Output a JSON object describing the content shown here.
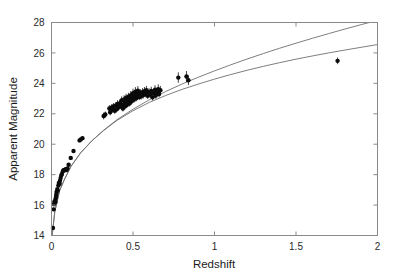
{
  "figure": {
    "name": "hubble-diagram",
    "background_color": "#ffffff",
    "frame_color": "#8a8a8a",
    "point_color": "#0a0a0a",
    "curve_color": "#6f6f6f"
  },
  "chart_data": {
    "type": "scatter",
    "title": "",
    "subtitle": "",
    "xlabel": "Redshift",
    "ylabel": "Apparent Magnitude",
    "xlim": [
      0,
      2
    ],
    "ylim": [
      14,
      28
    ],
    "y_inverted": false,
    "grid": false,
    "legend": null,
    "legend_position": "none",
    "xticks": [
      0,
      0.5,
      1,
      1.5,
      2
    ],
    "xtick_labels": [
      "0",
      "0.5",
      "1",
      "1.5",
      "2"
    ],
    "yticks": [
      14,
      16,
      18,
      20,
      22,
      24,
      26,
      28
    ],
    "ytick_labels": [
      "14",
      "16",
      "18",
      "20",
      "22",
      "24",
      "26",
      "28"
    ],
    "annotations": [],
    "series": [
      {
        "name": "supernovae",
        "marker": "filled-circle",
        "errorbars": "vertical",
        "x": [
          0.009,
          0.013,
          0.015,
          0.018,
          0.022,
          0.024,
          0.026,
          0.028,
          0.03,
          0.032,
          0.036,
          0.038,
          0.042,
          0.045,
          0.05,
          0.052,
          0.056,
          0.06,
          0.064,
          0.07,
          0.074,
          0.078,
          0.082,
          0.088,
          0.092,
          0.098,
          0.105,
          0.118,
          0.135,
          0.172,
          0.18,
          0.19,
          0.32,
          0.33,
          0.355,
          0.36,
          0.37,
          0.375,
          0.38,
          0.388,
          0.395,
          0.4,
          0.405,
          0.412,
          0.42,
          0.425,
          0.43,
          0.438,
          0.44,
          0.445,
          0.45,
          0.452,
          0.458,
          0.462,
          0.468,
          0.472,
          0.478,
          0.48,
          0.485,
          0.49,
          0.495,
          0.5,
          0.505,
          0.51,
          0.515,
          0.52,
          0.526,
          0.53,
          0.538,
          0.545,
          0.55,
          0.558,
          0.562,
          0.57,
          0.578,
          0.582,
          0.59,
          0.598,
          0.605,
          0.612,
          0.62,
          0.628,
          0.635,
          0.64,
          0.648,
          0.655,
          0.66,
          0.668,
          0.778,
          0.828,
          0.84,
          1.755
        ],
        "y": [
          14.5,
          15.72,
          16.05,
          16.22,
          16.28,
          16.2,
          16.45,
          16.6,
          16.75,
          16.9,
          17.05,
          16.95,
          17.28,
          17.45,
          17.4,
          17.6,
          17.78,
          17.95,
          18.05,
          18.22,
          18.3,
          18.28,
          18.32,
          18.35,
          18.3,
          18.4,
          18.65,
          19.1,
          19.55,
          20.25,
          20.32,
          20.4,
          21.85,
          21.95,
          22.35,
          22.1,
          22.42,
          22.28,
          22.48,
          22.2,
          22.55,
          22.3,
          22.65,
          22.42,
          22.7,
          22.52,
          22.88,
          22.35,
          22.62,
          22.95,
          22.48,
          22.75,
          23.05,
          22.58,
          22.85,
          23.12,
          22.68,
          22.98,
          23.2,
          22.8,
          23.08,
          23.35,
          22.92,
          23.18,
          23.45,
          23.02,
          23.28,
          23.52,
          23.1,
          23.38,
          23.15,
          23.42,
          23.22,
          23.48,
          23.3,
          23.55,
          23.18,
          23.42,
          23.25,
          23.5,
          23.08,
          23.35,
          23.58,
          23.2,
          23.45,
          23.62,
          23.3,
          23.55,
          24.38,
          24.45,
          24.2,
          25.48
        ],
        "yerr": [
          0.1,
          0.1,
          0.1,
          0.1,
          0.1,
          0.1,
          0.1,
          0.1,
          0.1,
          0.1,
          0.1,
          0.1,
          0.1,
          0.1,
          0.1,
          0.1,
          0.1,
          0.1,
          0.1,
          0.1,
          0.1,
          0.1,
          0.1,
          0.1,
          0.1,
          0.1,
          0.1,
          0.1,
          0.1,
          0.12,
          0.12,
          0.12,
          0.22,
          0.2,
          0.22,
          0.2,
          0.22,
          0.2,
          0.22,
          0.2,
          0.22,
          0.2,
          0.24,
          0.2,
          0.24,
          0.2,
          0.26,
          0.2,
          0.22,
          0.26,
          0.2,
          0.22,
          0.26,
          0.2,
          0.22,
          0.26,
          0.2,
          0.22,
          0.28,
          0.2,
          0.24,
          0.3,
          0.2,
          0.24,
          0.3,
          0.2,
          0.24,
          0.3,
          0.2,
          0.24,
          0.22,
          0.26,
          0.22,
          0.28,
          0.22,
          0.28,
          0.2,
          0.26,
          0.22,
          0.28,
          0.2,
          0.26,
          0.3,
          0.22,
          0.26,
          0.32,
          0.22,
          0.28,
          0.34,
          0.36,
          0.32,
          0.22
        ]
      }
    ],
    "curves": [
      {
        "name": "upper-model-curve",
        "description": "upper cosmological model line",
        "x": [
          0.0,
          0.02,
          0.05,
          0.08,
          0.12,
          0.18,
          0.25,
          0.32,
          0.4,
          0.5,
          0.6,
          0.7,
          0.8,
          0.9,
          1.0,
          1.1,
          1.2,
          1.3,
          1.4,
          1.5,
          1.6,
          1.7,
          1.8,
          1.9,
          2.0
        ],
        "y": [
          13.6,
          15.55,
          16.95,
          17.7,
          18.55,
          19.45,
          20.25,
          20.9,
          21.55,
          22.2,
          22.75,
          23.2,
          23.6,
          23.95,
          24.28,
          24.58,
          24.86,
          25.12,
          25.36,
          25.59,
          25.8,
          26.0,
          26.19,
          26.37,
          26.55
        ]
      },
      {
        "name": "lower-model-curve",
        "description": "lower cosmological model line",
        "x": [
          0.0,
          0.02,
          0.05,
          0.08,
          0.12,
          0.18,
          0.25,
          0.32,
          0.4,
          0.5,
          0.6,
          0.7,
          0.8,
          0.9,
          1.0,
          1.1,
          1.2,
          1.3,
          1.4,
          1.5,
          1.6,
          1.7,
          1.8,
          1.9,
          2.0
        ],
        "y": [
          13.6,
          15.55,
          16.95,
          17.7,
          18.55,
          19.45,
          20.25,
          20.92,
          21.6,
          22.3,
          22.92,
          23.46,
          23.95,
          24.4,
          24.82,
          25.22,
          25.6,
          25.96,
          26.31,
          26.64,
          26.96,
          27.27,
          27.57,
          27.86,
          28.14
        ]
      }
    ]
  }
}
